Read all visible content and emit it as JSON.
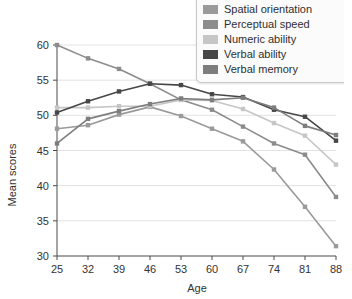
{
  "chart_data": {
    "type": "line",
    "title": "",
    "xlabel": "Age",
    "ylabel": "Mean scores",
    "x": [
      25,
      32,
      39,
      46,
      53,
      60,
      67,
      74,
      81,
      88
    ],
    "xtick_labels": [
      "25",
      "32",
      "39",
      "46",
      "53",
      "60",
      "67",
      "74",
      "81",
      "88"
    ],
    "ytick_labels": [
      "30",
      "35",
      "40",
      "45",
      "50",
      "55",
      "60"
    ],
    "yticks": [
      30,
      35,
      40,
      45,
      50,
      55,
      60
    ],
    "xlim": [
      25,
      88
    ],
    "ylim": [
      30,
      60
    ],
    "grid": "horizontal",
    "legend_position": "top-right",
    "markers": "square",
    "series": [
      {
        "name": "Spatial orientation",
        "color": "#9a9a9a",
        "values": [
          48.1,
          48.6,
          50.1,
          51.2,
          49.9,
          48.1,
          46.3,
          42.3,
          37.0,
          31.4
        ]
      },
      {
        "name": "Perceptual speed",
        "color": "#8c8c8c",
        "values": [
          60.0,
          58.1,
          56.6,
          54.5,
          52.2,
          50.8,
          48.4,
          46.0,
          44.4,
          38.4
        ]
      },
      {
        "name": "Numeric ability",
        "color": "#c6c6c6",
        "values": [
          51.1,
          51.1,
          51.3,
          51.3,
          52.2,
          52.1,
          50.9,
          48.9,
          47.1,
          43.0
        ]
      },
      {
        "name": "Verbal ability",
        "color": "#474747",
        "values": [
          50.4,
          52.0,
          53.4,
          54.5,
          54.3,
          53.0,
          52.6,
          50.8,
          49.8,
          46.4
        ]
      },
      {
        "name": "Verbal memory",
        "color": "#7d7d7d",
        "values": [
          46.0,
          49.5,
          50.6,
          51.6,
          52.4,
          52.2,
          52.5,
          51.1,
          48.5,
          47.2
        ]
      }
    ]
  }
}
